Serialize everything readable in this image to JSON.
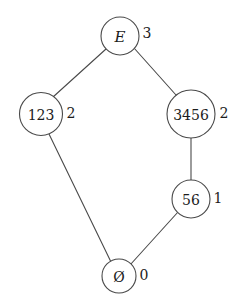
{
  "diagram": {
    "type": "hasse-lattice",
    "background_color": "#ffffff",
    "stroke_color": "#4a4a4a",
    "text_color": "#1c1c1c",
    "nodes": [
      {
        "id": "E",
        "label": "E",
        "rank_label": "3",
        "italic": true,
        "cx": 120,
        "cy": 36,
        "r": 19,
        "font_size": 15,
        "rank_x": 147,
        "rank_y": 33,
        "rank_font_size": 14
      },
      {
        "id": "123",
        "label": "123",
        "rank_label": "2",
        "italic": false,
        "cx": 41,
        "cy": 114,
        "r": 21.5,
        "font_size": 14,
        "rank_x": 71,
        "rank_y": 113,
        "rank_font_size": 14
      },
      {
        "id": "3456",
        "label": "3456",
        "rank_label": "2",
        "italic": false,
        "cx": 191,
        "cy": 114,
        "r": 24,
        "font_size": 14,
        "rank_x": 224,
        "rank_y": 113,
        "rank_font_size": 14
      },
      {
        "id": "56",
        "label": "56",
        "rank_label": "1",
        "italic": false,
        "cx": 191,
        "cy": 199,
        "r": 19,
        "font_size": 14,
        "rank_x": 218,
        "rank_y": 198,
        "rank_font_size": 14
      },
      {
        "id": "empty",
        "label": "Ø",
        "rank_label": "0",
        "italic": false,
        "cx": 119,
        "cy": 276,
        "r": 17,
        "font_size": 14,
        "rank_x": 144,
        "rank_y": 275,
        "rank_font_size": 14
      }
    ],
    "edges": [
      {
        "id": "E-123",
        "from": "E",
        "to": "123",
        "x1": 106,
        "y1": 49,
        "x2": 53,
        "y2": 97
      },
      {
        "id": "E-3456",
        "from": "E",
        "to": "3456",
        "x1": 134,
        "y1": 48,
        "x2": 176,
        "y2": 95
      },
      {
        "id": "123-empty",
        "from": "123",
        "to": "empty",
        "x1": 49,
        "y1": 134,
        "x2": 111,
        "y2": 262
      },
      {
        "id": "3456-56",
        "from": "3456",
        "to": "56",
        "x1": 191,
        "y1": 138,
        "x2": 191,
        "y2": 180
      },
      {
        "id": "56-empty",
        "from": "56",
        "to": "empty",
        "x1": 178,
        "y1": 212,
        "x2": 130,
        "y2": 265
      }
    ]
  }
}
